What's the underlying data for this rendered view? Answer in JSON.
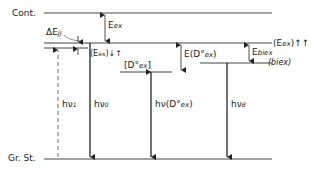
{
  "diagram": {
    "title": "",
    "levels": {
      "continuum": "Cont.",
      "ground_state": "Gr. St.",
      "exciton_parallel": "(E",
      "exciton_parallel_sub": "ex",
      "exciton_parallel_spin": ")↑↑",
      "biexciton": "(biex)",
      "bound_exciton": "[D°",
      "bound_exciton_sub": "ex",
      "bound_exciton_close": "]",
      "exciton_split": "(E",
      "exciton_split_sub": "ex",
      "exciton_split_spin": ")↓↑"
    },
    "energies": {
      "delta_e": "ΔE",
      "delta_e_sub": "jj",
      "e_ex": "E",
      "e_ex_sub": "ex",
      "e_d0ex": "E(D°",
      "e_d0ex_sub": "ex",
      "e_d0ex_close": ")",
      "e_biex": "E",
      "e_biex_sub": "biex"
    },
    "transitions": {
      "hv1": "hν",
      "hv1_sub": "1",
      "hv0": "hν",
      "hv0_sub": "0",
      "hv_d0ex": "hν(D°",
      "hv_d0ex_sub": "ex",
      "hv_d0ex_close": ")",
      "hvb": "hν",
      "hvb_sub": "B"
    }
  }
}
